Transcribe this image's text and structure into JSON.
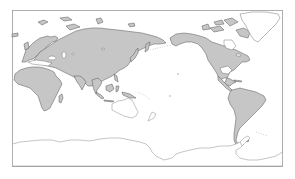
{
  "map": {
    "projection": "equirectangular, Pacific-centered",
    "colors": {
      "land": "#c6c6c6",
      "coast": "#555555",
      "unfilled_outline": "#8a8a8a",
      "ocean": "#ffffff",
      "frame": "#9a9a9a"
    },
    "regions": [
      {
        "name": "Europe",
        "filled": true
      },
      {
        "name": "Asia",
        "filled": true
      },
      {
        "name": "Africa",
        "filled": true
      },
      {
        "name": "North America",
        "filled": true
      },
      {
        "name": "South America",
        "filled": true
      },
      {
        "name": "Greenland",
        "filled": false
      },
      {
        "name": "Australia",
        "filled": false
      },
      {
        "name": "New Zealand",
        "filled": false
      },
      {
        "name": "Antarctica",
        "filled": false
      }
    ]
  }
}
